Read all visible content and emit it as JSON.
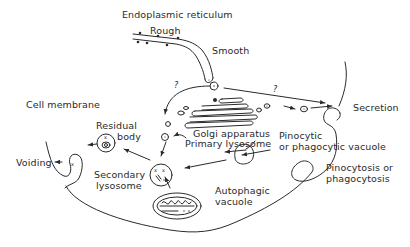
{
  "diagram": {
    "labels": {
      "er": "Endoplasmic reticulum",
      "rough": "Rough",
      "smooth": "Smooth",
      "cell_membrane": "Cell membrane",
      "residual_line1": "Residual",
      "residual_line2": "body",
      "golgi": "Golgi apparatus",
      "primary_lysosome": "Primary lysosome",
      "pino_vac_line1": "Pinocytic",
      "pino_vac_line2": "or phagocytic vacuole",
      "secretion": "Secretion",
      "voiding": "Voiding",
      "secondary_line1": "Secondary",
      "secondary_line2": "lysosome",
      "autophagic_line1": "Autophagic",
      "autophagic_line2": "vacuole",
      "pinocytosis_line1": "Pinocytosis or",
      "pinocytosis_line2": "phagocytosis",
      "question1": "?",
      "question2": "?"
    },
    "nodes": [
      {
        "id": "er",
        "name": "Endoplasmic reticulum (rough & smooth)"
      },
      {
        "id": "golgi",
        "name": "Golgi apparatus"
      },
      {
        "id": "primary",
        "name": "Primary lysosome"
      },
      {
        "id": "secondary",
        "name": "Secondary lysosome"
      },
      {
        "id": "residual",
        "name": "Residual body"
      },
      {
        "id": "autophagic",
        "name": "Autophagic vacuole"
      },
      {
        "id": "pino",
        "name": "Pinocytic or phagocytic vacuole"
      },
      {
        "id": "secretion",
        "name": "Secretion"
      },
      {
        "id": "voiding",
        "name": "Voiding"
      }
    ],
    "edges": [
      {
        "from": "er",
        "to": "primary",
        "label": "?"
      },
      {
        "from": "er",
        "to": "secretion",
        "label": "?"
      },
      {
        "from": "golgi",
        "to": "secretion"
      },
      {
        "from": "primary",
        "to": "secondary"
      },
      {
        "from": "pino",
        "to": "secondary"
      },
      {
        "from": "pino",
        "to": "primary"
      },
      {
        "from": "autophagic",
        "to": "secondary"
      },
      {
        "from": "secondary",
        "to": "residual"
      },
      {
        "from": "residual",
        "to": "voiding"
      }
    ]
  }
}
